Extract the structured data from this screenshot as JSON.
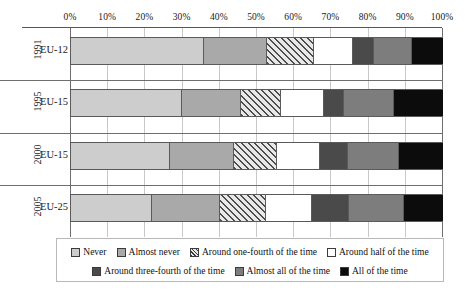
{
  "chart_data": {
    "type": "bar",
    "orientation": "horizontal",
    "stacked": true,
    "normalized": "100%",
    "title": "",
    "xlabel": "",
    "ylabel": "",
    "xlim": [
      0,
      100
    ],
    "grid": true,
    "legend_position": "bottom",
    "xticks": [
      "0%",
      "10%",
      "20%",
      "30%",
      "40%",
      "50%",
      "60%",
      "70%",
      "80%",
      "90%",
      "100%"
    ],
    "xtick_values": [
      0,
      10,
      20,
      30,
      40,
      50,
      60,
      70,
      80,
      90,
      100
    ],
    "categories": [
      "1991",
      "1995",
      "2000",
      "2005"
    ],
    "group_sublabels": [
      "EU-12",
      "EU-15",
      "EU-15",
      "EU-25"
    ],
    "series": [
      {
        "name": "Never",
        "values": [
          35.8,
          29.8,
          26.6,
          21.8
        ]
      },
      {
        "name": "Almost never",
        "values": [
          16.9,
          15.9,
          17.2,
          18.2
        ]
      },
      {
        "name": "Around one-fourth of the time",
        "values": [
          12.6,
          10.8,
          11.6,
          12.4
        ]
      },
      {
        "name": "Around half of the time",
        "values": [
          10.5,
          11.5,
          11.5,
          12.4
        ]
      },
      {
        "name": "Around three-fourth of the time",
        "values": [
          5.7,
          5.4,
          7.6,
          9.9
        ]
      },
      {
        "name": "Almost all of the time",
        "values": [
          10.2,
          13.4,
          13.7,
          14.8
        ]
      },
      {
        "name": "All of the time",
        "values": [
          8.3,
          13.2,
          11.8,
          10.5
        ]
      }
    ],
    "series_colors": [
      "#cdcdcd",
      "#a9a9a9",
      "#hatched",
      "#ffffff",
      "#4a4a4a",
      "#7d7d7d",
      "#0c0c0c"
    ]
  },
  "axis": {
    "ticks": [
      {
        "label": "0%",
        "value": 0
      },
      {
        "label": "10%",
        "value": 10
      },
      {
        "label": "20%",
        "value": 20
      },
      {
        "label": "30%",
        "value": 30
      },
      {
        "label": "40%",
        "value": 40
      },
      {
        "label": "50%",
        "value": 50
      },
      {
        "label": "60%",
        "value": 60
      },
      {
        "label": "70%",
        "value": 70
      },
      {
        "label": "80%",
        "value": 80
      },
      {
        "label": "90%",
        "value": 90
      },
      {
        "label": "100%",
        "value": 100
      }
    ]
  },
  "groups": [
    {
      "year": "1991",
      "region": "EU-12"
    },
    {
      "year": "1995",
      "region": "EU-15"
    },
    {
      "year": "2000",
      "region": "EU-15"
    },
    {
      "year": "2005",
      "region": "EU-25"
    }
  ],
  "legend": {
    "row1": [
      {
        "label": "Never",
        "swatch": "#cdcdcd",
        "pattern": "solid"
      },
      {
        "label": "Almost never",
        "swatch": "#a9a9a9",
        "pattern": "solid"
      },
      {
        "label": "Around one-fourth of the time",
        "swatch": "#e8e8e8",
        "pattern": "hatch"
      },
      {
        "label": "Around half of the time",
        "swatch": "#ffffff",
        "pattern": "solid"
      }
    ],
    "row2": [
      {
        "label": "Around three-fourth of the time",
        "swatch": "#4a4a4a",
        "pattern": "solid"
      },
      {
        "label": "Almost all of the time",
        "swatch": "#7d7d7d",
        "pattern": "solid"
      },
      {
        "label": "All of the time",
        "swatch": "#0c0c0c",
        "pattern": "solid"
      }
    ]
  }
}
